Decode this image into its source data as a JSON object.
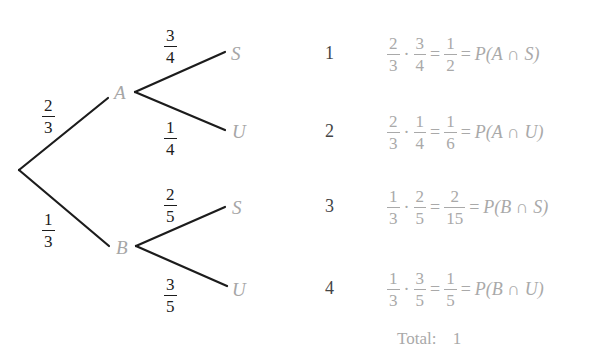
{
  "diagram": {
    "type": "probability-tree",
    "root": {
      "x": 19,
      "y": 170
    },
    "level1": [
      {
        "label": "A",
        "prob": {
          "num": "2",
          "den": "3"
        }
      },
      {
        "label": "B",
        "prob": {
          "num": "1",
          "den": "3"
        }
      }
    ],
    "level2": {
      "A": [
        {
          "label": "S",
          "prob": {
            "num": "3",
            "den": "4"
          }
        },
        {
          "label": "U",
          "prob": {
            "num": "1",
            "den": "4"
          }
        }
      ],
      "B": [
        {
          "label": "S",
          "prob": {
            "num": "2",
            "den": "5"
          }
        },
        {
          "label": "U",
          "prob": {
            "num": "3",
            "den": "5"
          }
        }
      ]
    },
    "colors": {
      "lines": "#1c1c1c",
      "node_labels": "#a6a6a6",
      "equations": "#a9a9a9",
      "row_numbers": "#444444"
    }
  },
  "outcomes": [
    {
      "n": "1",
      "f1": {
        "num": "2",
        "den": "3"
      },
      "f2": {
        "num": "3",
        "den": "4"
      },
      "res": {
        "num": "1",
        "den": "2"
      },
      "dot": "·",
      "eq": "=",
      "event": "P(A ∩ S)"
    },
    {
      "n": "2",
      "f1": {
        "num": "2",
        "den": "3"
      },
      "f2": {
        "num": "1",
        "den": "4"
      },
      "res": {
        "num": "1",
        "den": "6"
      },
      "dot": "·",
      "eq": "=",
      "event": "P(A ∩ U)"
    },
    {
      "n": "3",
      "f1": {
        "num": "1",
        "den": "3"
      },
      "f2": {
        "num": "2",
        "den": "5"
      },
      "res": {
        "num": "2",
        "den": "15"
      },
      "dot": "·",
      "eq": "=",
      "event": "P(B ∩ S)"
    },
    {
      "n": "4",
      "f1": {
        "num": "1",
        "den": "3"
      },
      "f2": {
        "num": "3",
        "den": "5"
      },
      "res": {
        "num": "1",
        "den": "5"
      },
      "dot": "·",
      "eq": "=",
      "event": "P(B ∩ U)"
    }
  ],
  "total": {
    "label": "Total:",
    "value": "1"
  }
}
